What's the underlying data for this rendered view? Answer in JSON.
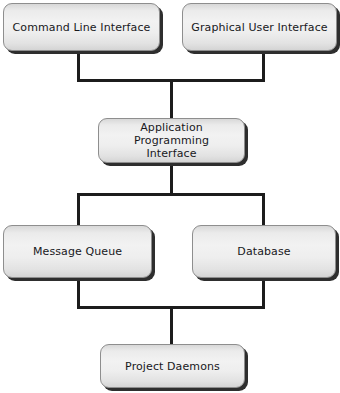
{
  "diagram": {
    "type": "block-hierarchy",
    "background_color": "#ffffff",
    "node_fill_color": "#eeeeee",
    "node_border_color": "#8e8e8e",
    "node_shadow_color": "#2e2e2e",
    "connector_color": "#1c1c1c",
    "text_color": "#18181c",
    "nodes": [
      {
        "id": "cli",
        "label": "Command Line Interface",
        "row": 1
      },
      {
        "id": "gui",
        "label": "Graphical User Interface",
        "row": 1
      },
      {
        "id": "api",
        "label": "Application Programming\nInterface",
        "row": 2
      },
      {
        "id": "mq",
        "label": "Message Queue",
        "row": 3
      },
      {
        "id": "db",
        "label": "Database",
        "row": 3
      },
      {
        "id": "pd",
        "label": "Project Daemons",
        "row": 4
      }
    ],
    "edges": [
      {
        "from": "cli",
        "to": "api"
      },
      {
        "from": "gui",
        "to": "api"
      },
      {
        "from": "api",
        "to": "mq"
      },
      {
        "from": "api",
        "to": "db"
      },
      {
        "from": "mq",
        "to": "pd"
      },
      {
        "from": "db",
        "to": "pd"
      }
    ]
  }
}
